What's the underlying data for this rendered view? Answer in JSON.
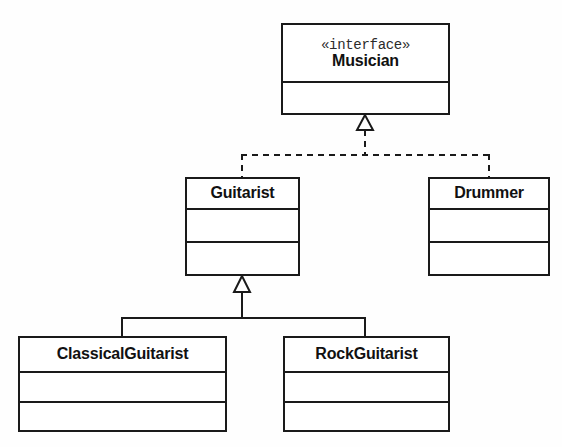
{
  "diagram": {
    "kind": "uml-class-diagram",
    "background_color": "#fefefe",
    "line_color": "#1a1a1a",
    "text_color": "#111111",
    "classes": [
      {
        "id": "musician",
        "name": "Musician",
        "stereotype": "«interface»",
        "compartments": 2,
        "x": 281,
        "y": 23,
        "width": 169,
        "height": 92
      },
      {
        "id": "guitarist",
        "name": "Guitarist",
        "stereotype": "",
        "compartments": 3,
        "x": 185,
        "y": 177,
        "width": 115,
        "height": 99
      },
      {
        "id": "drummer",
        "name": "Drummer",
        "stereotype": "",
        "compartments": 3,
        "x": 428,
        "y": 177,
        "width": 122,
        "height": 99
      },
      {
        "id": "classical-guitarist",
        "name": "ClassicalGuitarist",
        "stereotype": "",
        "compartments": 3,
        "x": 18,
        "y": 336,
        "width": 209,
        "height": 96
      },
      {
        "id": "rock-guitarist",
        "name": "RockGuitarist",
        "stereotype": "",
        "compartments": 3,
        "x": 283,
        "y": 336,
        "width": 167,
        "height": 96
      }
    ],
    "relationships": [
      {
        "id": "realization-musician",
        "type": "realization",
        "line_style": "dashed",
        "arrowhead": "hollow-triangle",
        "target": "musician",
        "sources": [
          "guitarist",
          "drummer"
        ]
      },
      {
        "id": "generalization-guitarist",
        "type": "generalization",
        "line_style": "solid",
        "arrowhead": "hollow-triangle",
        "target": "guitarist",
        "sources": [
          "classical-guitarist",
          "rock-guitarist"
        ]
      }
    ]
  }
}
